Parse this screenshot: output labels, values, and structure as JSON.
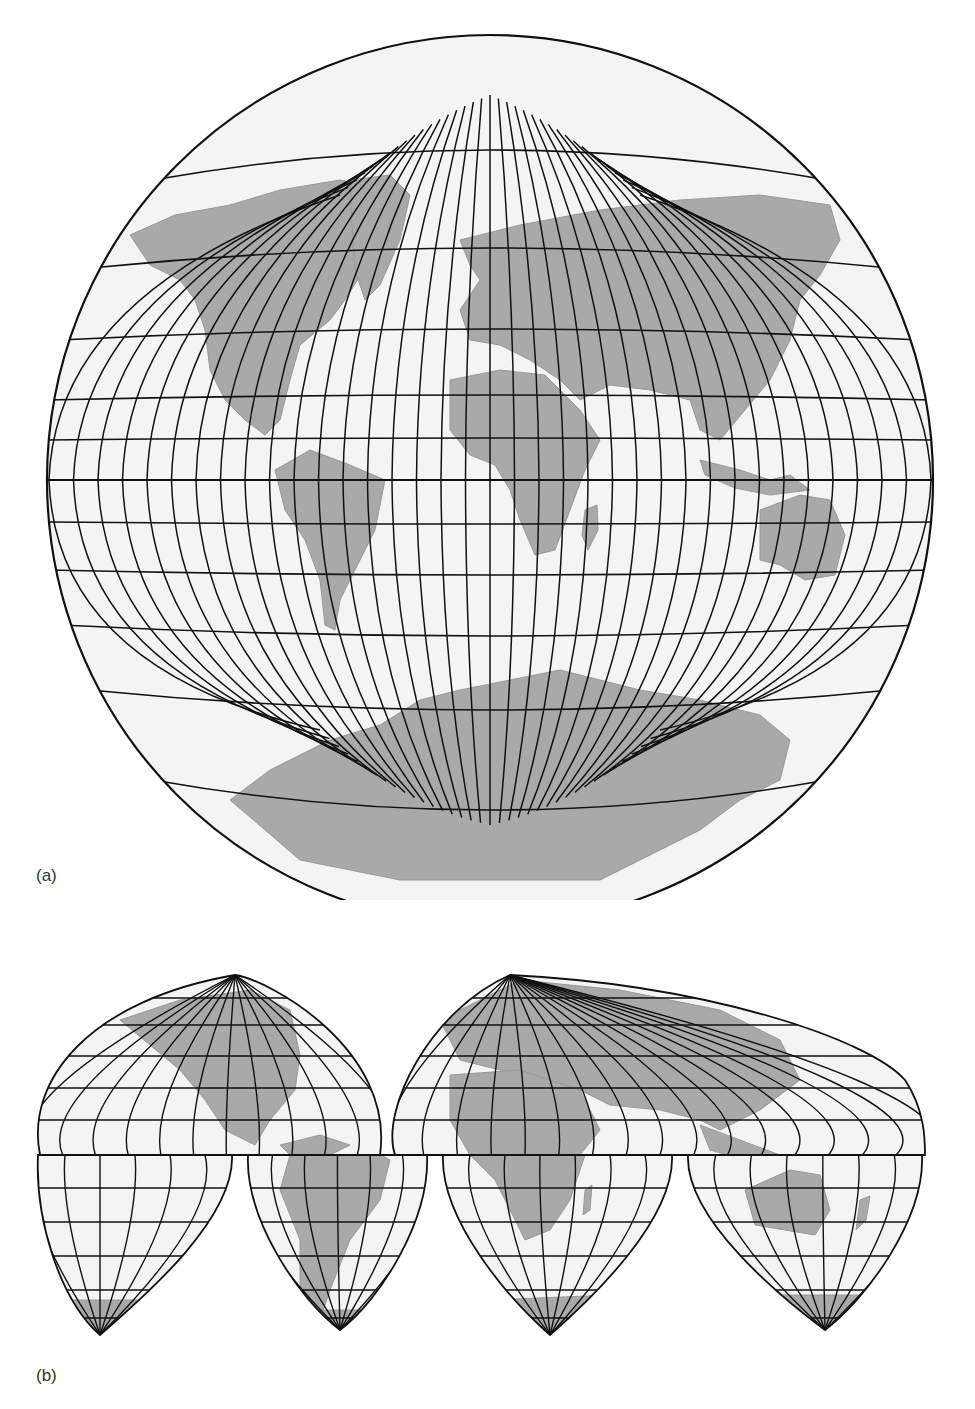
{
  "figure": {
    "panels": [
      {
        "id": "a",
        "label": "(a)",
        "projection_style": "globular world map (single ellipse, polar regions with converging meridians)",
        "graticule": {
          "parallel_spacing_deg": 15,
          "meridian_spacing_deg": 10
        },
        "land_color": "#a9a9a9",
        "ocean_color": "#f4f4f4",
        "line_color": "#111111"
      },
      {
        "id": "b",
        "label": "(b)",
        "projection_style": "interrupted world map (Goode-style lobes)",
        "lobes_north": 2,
        "lobes_south": 4,
        "graticule": {
          "parallel_spacing_deg": 10,
          "meridian_spacing_deg": 10
        },
        "land_color": "#a9a9a9",
        "ocean_color": "#f4f4f4",
        "line_color": "#111111"
      }
    ]
  }
}
